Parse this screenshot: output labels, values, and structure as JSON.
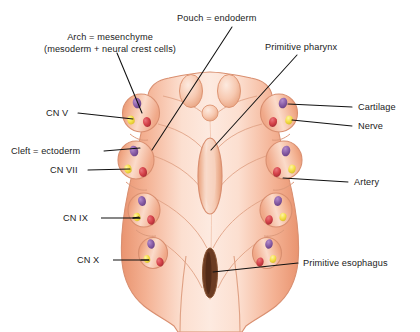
{
  "diagram": {
    "type": "anatomical-illustration",
    "background_color": "#ffffff",
    "text_color": "#1b1b1b",
    "leader_line_color": "#111111",
    "palette": {
      "tissue_light": "#fbe0d2",
      "tissue_mid": "#f3b89c",
      "tissue_dark": "#e79273",
      "outline": "#d98f70",
      "cartilage_purple": "#8a5fa8",
      "nerve_yellow": "#f5e04a",
      "artery_red": "#d6434a",
      "esophagus_brown": "#6b3b22"
    }
  },
  "labels": {
    "arch": {
      "line1": "Arch = mesenchyme",
      "line2": "(mesoderm + neural crest cells)"
    },
    "pouch": "Pouch = endoderm",
    "primitive_pharynx": "Primitive pharynx",
    "cartilage": "Cartilage",
    "nerve": "Nerve",
    "artery": "Artery",
    "cleft": "Cleft = ectoderm",
    "primitive_esophagus": "Primitive esophagus",
    "cn_v": "CN V",
    "cn_vii": "CN VII",
    "cn_ix": "CN IX",
    "cn_x": "CN X"
  },
  "structures": {
    "arch_components": [
      {
        "name": "cartilage",
        "color": "#8a5fa8"
      },
      {
        "name": "nerve",
        "color": "#f5e04a"
      },
      {
        "name": "artery",
        "color": "#d6434a"
      }
    ],
    "cranial_nerves": [
      "CN V",
      "CN VII",
      "CN IX",
      "CN X"
    ],
    "arch_count_per_side": 4
  }
}
